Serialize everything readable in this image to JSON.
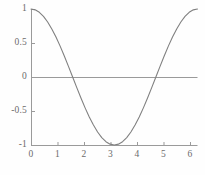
{
  "chart_data": {
    "type": "line",
    "title": "",
    "subtitle": "",
    "xlabel": "",
    "ylabel": "",
    "xlim": [
      0,
      6.2832
    ],
    "ylim": [
      -1,
      1
    ],
    "grid": false,
    "legend": null,
    "legend_position": "none",
    "x_ticks": [
      {
        "value": 0,
        "label": "0"
      },
      {
        "value": 1,
        "label": "1"
      },
      {
        "value": 2,
        "label": "2"
      },
      {
        "value": 3,
        "label": "3"
      },
      {
        "value": 4,
        "label": "4"
      },
      {
        "value": 5,
        "label": "5"
      },
      {
        "value": 6,
        "label": "6"
      }
    ],
    "y_ticks": [
      {
        "value": 1,
        "label": "1"
      },
      {
        "value": 0.5,
        "label": "0.5"
      },
      {
        "value": 0,
        "label": "0"
      },
      {
        "value": -0.5,
        "label": "-0.5"
      },
      {
        "value": -1,
        "label": "-1"
      }
    ],
    "series": [
      {
        "name": "cos(x)",
        "color": "#808080",
        "x": [
          0,
          0.1571,
          0.3142,
          0.4712,
          0.6283,
          0.7854,
          0.9425,
          1.0996,
          1.2566,
          1.4137,
          1.5708,
          1.7279,
          1.885,
          2.042,
          2.1991,
          2.3562,
          2.5133,
          2.6704,
          2.8274,
          2.9845,
          3.1416,
          3.2987,
          3.4558,
          3.6128,
          3.7699,
          3.927,
          4.0841,
          4.2412,
          4.3982,
          4.5553,
          4.7124,
          4.8695,
          5.0265,
          5.1836,
          5.3407,
          5.4978,
          5.6549,
          5.8119,
          5.969,
          6.1261,
          6.2832
        ],
        "y": [
          1,
          0.9877,
          0.9511,
          0.891,
          0.809,
          0.7071,
          0.5878,
          0.454,
          0.309,
          0.1564,
          0,
          -0.1564,
          -0.309,
          -0.454,
          -0.5878,
          -0.7071,
          -0.809,
          -0.891,
          -0.9511,
          -0.9877,
          -1,
          -0.9877,
          -0.9511,
          -0.891,
          -0.809,
          -0.7071,
          -0.5878,
          -0.454,
          -0.309,
          -0.1564,
          0,
          0.1564,
          0.309,
          0.454,
          0.5878,
          0.7071,
          0.809,
          0.891,
          0.9511,
          0.9877,
          1
        ]
      }
    ],
    "axis_color": "#9a9a9a",
    "zero_line": true,
    "baseline_axis": true
  }
}
